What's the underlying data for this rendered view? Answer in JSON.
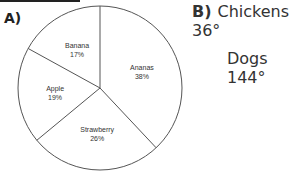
{
  "part_a": {
    "label": "A)"
  },
  "part_b": {
    "label": "B)",
    "lines": [
      "Chickens 36°",
      "Dogs 144°"
    ]
  },
  "chart_data": {
    "type": "pie",
    "title": "",
    "categories": [
      "Ananas",
      "Strawberry",
      "Apple",
      "Banana"
    ],
    "values": [
      38,
      26,
      19,
      17
    ],
    "labels": [
      "Ananas\n38%",
      "Strawberry\n26%",
      "Apple\n19%",
      "Banana\n17%"
    ],
    "slices": [
      {
        "name": "Ananas",
        "value": 38,
        "text": "38%"
      },
      {
        "name": "Strawberry",
        "value": 26,
        "text": "26%"
      },
      {
        "name": "Apple",
        "value": 19,
        "text": "19%"
      },
      {
        "name": "Banana",
        "value": 17,
        "text": "17%"
      }
    ],
    "legend": "none"
  }
}
